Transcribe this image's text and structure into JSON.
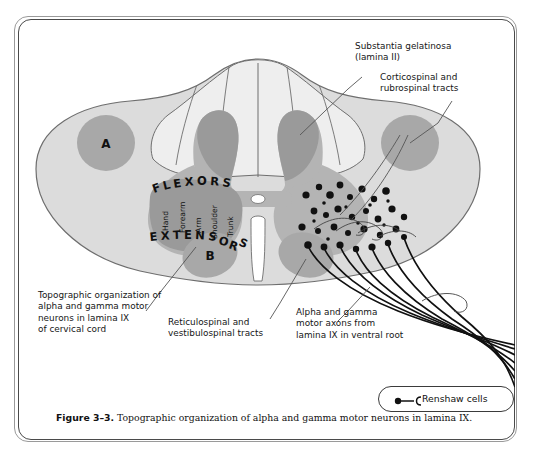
{
  "figure": {
    "number": "Figure 3–3.",
    "caption": "Topographic organization of alpha and gamma motor neurons in lamina IX."
  },
  "diagram": {
    "region_marks": [
      {
        "id": "A",
        "label": "A"
      },
      {
        "id": "B",
        "label": "B"
      }
    ],
    "motor_pool": {
      "flexors_label": "FLEXORS",
      "extensors_label": "EXTENSORS",
      "somatotopy": [
        "Hand",
        "Forearm",
        "Arm",
        "Shoulder",
        "Trunk"
      ]
    },
    "annotations": [
      {
        "id": "substantia-gelatinosa",
        "text": "Substantia gelatinosa\n(lamina II)"
      },
      {
        "id": "corticospinal-rubrospinal",
        "text": "Corticospinal and\nrubrospinal tracts"
      },
      {
        "id": "topographic-organization",
        "text": "Topographic organization of\nalpha and gamma motor\nneurons in lamina IX\nof cervical cord"
      },
      {
        "id": "reticulospinal-vestibulospinal",
        "text": "Reticulospinal and\nvestibulospinal tracts"
      },
      {
        "id": "alpha-gamma-axons",
        "text": "Alpha and gamma\nmotor axons from\nlamina IX in ventral root"
      }
    ]
  },
  "legend": {
    "label": "Renshaw cells"
  },
  "colors": {
    "white_matter": "#dcdcdc",
    "gray_matter": "#b4b4b4",
    "dark_gray": "#9a9a9a",
    "tract_circle": "#a8a8a8",
    "outline": "#6e6e6e",
    "text": "#161616"
  }
}
